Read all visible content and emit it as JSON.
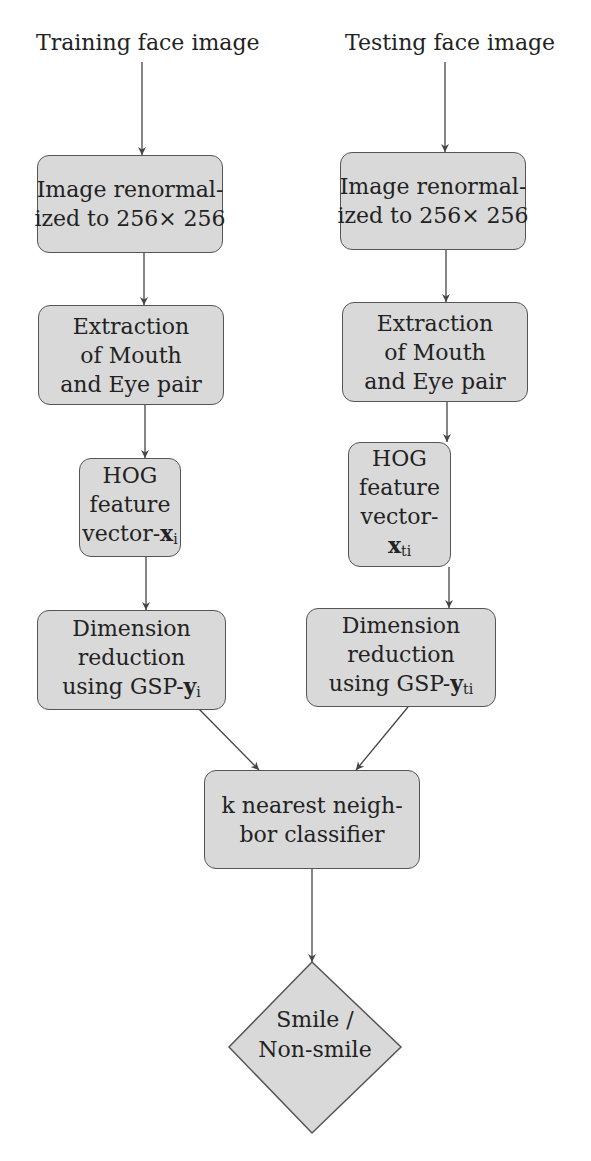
{
  "diagram": {
    "title_left": "Training face image",
    "title_right": "Testing face image",
    "left_branch": {
      "renormalize": {
        "line1": "Image renormal-",
        "line2": "ized to 256× 256"
      },
      "extraction": {
        "line1": "Extraction",
        "line2": "of Mouth",
        "line3": "and Eye pair"
      },
      "hog": {
        "line1": "HOG",
        "line2": "feature",
        "line3_prefix": "vector-",
        "var": "x",
        "var_sub": "i"
      },
      "dimension": {
        "line1": "Dimension",
        "line2": "reduction",
        "line3_prefix": "using GSP-",
        "var": "y",
        "var_sub": "i"
      }
    },
    "right_branch": {
      "renormalize": {
        "line1": "Image renormal-",
        "line2": "ized to 256× 256"
      },
      "extraction": {
        "line1": "Extraction",
        "line2": "of Mouth",
        "line3": "and Eye pair"
      },
      "hog": {
        "line1": "HOG",
        "line2": "feature",
        "line3": "vector-",
        "var": "x",
        "var_sub": "ti"
      },
      "dimension": {
        "line1": "Dimension",
        "line2": "reduction",
        "line3_prefix": "using GSP-",
        "var": "y",
        "var_sub": "ti"
      }
    },
    "classifier": {
      "line1": "k nearest neigh-",
      "line2": "bor classifier"
    },
    "decision": {
      "line1": "Smile /",
      "line2": "Non-smile"
    },
    "colors": {
      "node_fill": "#d9d9d9",
      "node_border": "#555555",
      "edge": "#444444",
      "background": "#ffffff"
    }
  }
}
